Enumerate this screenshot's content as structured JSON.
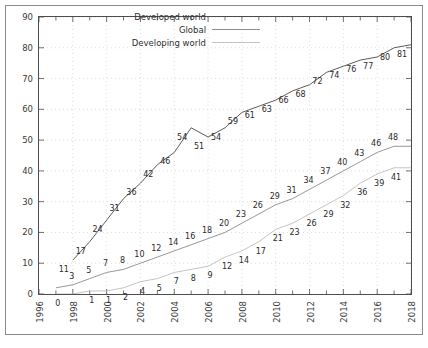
{
  "chart_data": {
    "type": "line",
    "title": "",
    "subtitle": "",
    "xlabel": "",
    "ylabel": "",
    "xlim": [
      1996,
      2018
    ],
    "ylim": [
      0,
      90
    ],
    "y_ticks": [
      0,
      10,
      20,
      30,
      40,
      50,
      60,
      70,
      80,
      90
    ],
    "x_ticks": [
      1996,
      1998,
      2000,
      2002,
      2004,
      2006,
      2008,
      2010,
      2012,
      2014,
      2016,
      2018
    ],
    "x_tick_labels": [
      "1996",
      "1998",
      "2000",
      "2002",
      "2004",
      "2006",
      "2008",
      "2010",
      "2012",
      "2014",
      "2016",
      "2018"
    ],
    "grid": true,
    "grid_style": "dotted",
    "legend_position": "top-center",
    "data_labels": true,
    "x": [
      1996,
      1997,
      1998,
      1999,
      2000,
      2001,
      2002,
      2003,
      2004,
      2005,
      2006,
      2007,
      2008,
      2009,
      2010,
      2011,
      2012,
      2013,
      2014,
      2015,
      2016,
      2017,
      2018
    ],
    "series": [
      {
        "name": "Developed world",
        "color": "#4a4a4a",
        "x": [
          1998,
          1999,
          2000,
          2001,
          2002,
          2003,
          2004,
          2005,
          2006,
          2007,
          2008,
          2009,
          2010,
          2011,
          2012,
          2013,
          2014,
          2015,
          2016,
          2017,
          2018
        ],
        "values": [
          11,
          17,
          24,
          31,
          36,
          42,
          46,
          54,
          51,
          54,
          59,
          61,
          63,
          66,
          68,
          72,
          74,
          76,
          77,
          80,
          81
        ]
      },
      {
        "name": "Global",
        "color": "#8c8c8c",
        "x": [
          1997,
          1998,
          1999,
          2000,
          2001,
          2002,
          2003,
          2004,
          2005,
          2006,
          2007,
          2008,
          2009,
          2010,
          2011,
          2012,
          2013,
          2014,
          2015,
          2016,
          2017,
          2018
        ],
        "values": [
          2,
          3,
          5,
          7,
          8,
          10,
          12,
          14,
          16,
          18,
          20,
          23,
          26,
          29,
          31,
          34,
          37,
          40,
          43,
          46,
          48,
          48
        ]
      },
      {
        "name": "Developing world",
        "color": "#bdbdbd",
        "x": [
          1997,
          1998,
          1999,
          2000,
          2001,
          2002,
          2003,
          2004,
          2005,
          2006,
          2007,
          2008,
          2009,
          2010,
          2011,
          2012,
          2013,
          2014,
          2015,
          2016,
          2017,
          2018
        ],
        "values": [
          0,
          0,
          1,
          1,
          2,
          4,
          5,
          7,
          8,
          9,
          12,
          14,
          17,
          21,
          23,
          26,
          29,
          32,
          36,
          39,
          41,
          41
        ]
      }
    ],
    "point_labels": {
      "Developed world": [
        {
          "x": 1998,
          "y": 11,
          "text": "11"
        },
        {
          "x": 1999,
          "y": 17,
          "text": "17"
        },
        {
          "x": 2000,
          "y": 24,
          "text": "24"
        },
        {
          "x": 2001,
          "y": 31,
          "text": "31"
        },
        {
          "x": 2002,
          "y": 36,
          "text": "36"
        },
        {
          "x": 2003,
          "y": 42,
          "text": "42"
        },
        {
          "x": 2004,
          "y": 46,
          "text": "46"
        },
        {
          "x": 2005,
          "y": 54,
          "text": "54"
        },
        {
          "x": 2006,
          "y": 51,
          "text": "51"
        },
        {
          "x": 2007,
          "y": 54,
          "text": "54"
        },
        {
          "x": 2008,
          "y": 59,
          "text": "59"
        },
        {
          "x": 2009,
          "y": 61,
          "text": "61"
        },
        {
          "x": 2010,
          "y": 63,
          "text": "63"
        },
        {
          "x": 2011,
          "y": 66,
          "text": "66"
        },
        {
          "x": 2012,
          "y": 68,
          "text": "68"
        },
        {
          "x": 2013,
          "y": 72,
          "text": "72"
        },
        {
          "x": 2014,
          "y": 74,
          "text": "74"
        },
        {
          "x": 2015,
          "y": 76,
          "text": "76"
        },
        {
          "x": 2016,
          "y": 77,
          "text": "77"
        },
        {
          "x": 2017,
          "y": 80,
          "text": "80"
        },
        {
          "x": 2018,
          "y": 81,
          "text": "81"
        }
      ],
      "Global": [
        {
          "x": 1998,
          "y": 3,
          "text": "3"
        },
        {
          "x": 1999,
          "y": 5,
          "text": "5"
        },
        {
          "x": 2000,
          "y": 7,
          "text": "7"
        },
        {
          "x": 2001,
          "y": 8,
          "text": "8"
        },
        {
          "x": 2002,
          "y": 10,
          "text": "10"
        },
        {
          "x": 2003,
          "y": 12,
          "text": "12"
        },
        {
          "x": 2004,
          "y": 14,
          "text": "14"
        },
        {
          "x": 2005,
          "y": 16,
          "text": "16"
        },
        {
          "x": 2006,
          "y": 18,
          "text": "18"
        },
        {
          "x": 2007,
          "y": 20,
          "text": "20"
        },
        {
          "x": 2008,
          "y": 23,
          "text": "23"
        },
        {
          "x": 2009,
          "y": 26,
          "text": "26"
        },
        {
          "x": 2010,
          "y": 29,
          "text": "29"
        },
        {
          "x": 2011,
          "y": 31,
          "text": "31"
        },
        {
          "x": 2012,
          "y": 34,
          "text": "34"
        },
        {
          "x": 2013,
          "y": 37,
          "text": "37"
        },
        {
          "x": 2014,
          "y": 40,
          "text": "40"
        },
        {
          "x": 2015,
          "y": 43,
          "text": "43"
        },
        {
          "x": 2016,
          "y": 46,
          "text": "46"
        },
        {
          "x": 2017,
          "y": 48,
          "text": "48"
        }
      ],
      "Developing world": [
        {
          "x": 1997,
          "y": 0,
          "text": "0"
        },
        {
          "x": 1999,
          "y": 1,
          "text": "1"
        },
        {
          "x": 2000,
          "y": 1,
          "text": "1"
        },
        {
          "x": 2001,
          "y": 2,
          "text": "2"
        },
        {
          "x": 2002,
          "y": 4,
          "text": "4"
        },
        {
          "x": 2003,
          "y": 5,
          "text": "5"
        },
        {
          "x": 2004,
          "y": 7,
          "text": "7"
        },
        {
          "x": 2005,
          "y": 8,
          "text": "8"
        },
        {
          "x": 2006,
          "y": 9,
          "text": "9"
        },
        {
          "x": 2007,
          "y": 12,
          "text": "12"
        },
        {
          "x": 2008,
          "y": 14,
          "text": "14"
        },
        {
          "x": 2009,
          "y": 17,
          "text": "17"
        },
        {
          "x": 2010,
          "y": 21,
          "text": "21"
        },
        {
          "x": 2011,
          "y": 23,
          "text": "23"
        },
        {
          "x": 2012,
          "y": 26,
          "text": "26"
        },
        {
          "x": 2013,
          "y": 29,
          "text": "29"
        },
        {
          "x": 2014,
          "y": 32,
          "text": "32"
        },
        {
          "x": 2015,
          "y": 36,
          "text": "36"
        },
        {
          "x": 2016,
          "y": 39,
          "text": "39"
        },
        {
          "x": 2017,
          "y": 41,
          "text": "41"
        }
      ]
    }
  },
  "legend": {
    "entries": [
      {
        "label": "Developed world",
        "color": "#4a4a4a"
      },
      {
        "label": "Global",
        "color": "#8c8c8c"
      },
      {
        "label": "Developing world",
        "color": "#c4c4c4"
      }
    ]
  },
  "axes": {
    "y_tick_labels": [
      "0",
      "10",
      "20",
      "30",
      "40",
      "50",
      "60",
      "70",
      "80",
      "90"
    ],
    "x_tick_labels": [
      "1996",
      "1998",
      "2000",
      "2002",
      "2004",
      "2006",
      "2008",
      "2010",
      "2012",
      "2014",
      "2016",
      "2018"
    ]
  }
}
